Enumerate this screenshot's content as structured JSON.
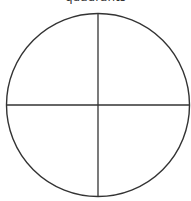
{
  "diagram": {
    "title": "quadrants",
    "shape": "circle divided into four quadrants",
    "center": [
      98,
      105
    ],
    "radius": 92,
    "stroke_color": "#333333",
    "background": "#ffffff"
  }
}
